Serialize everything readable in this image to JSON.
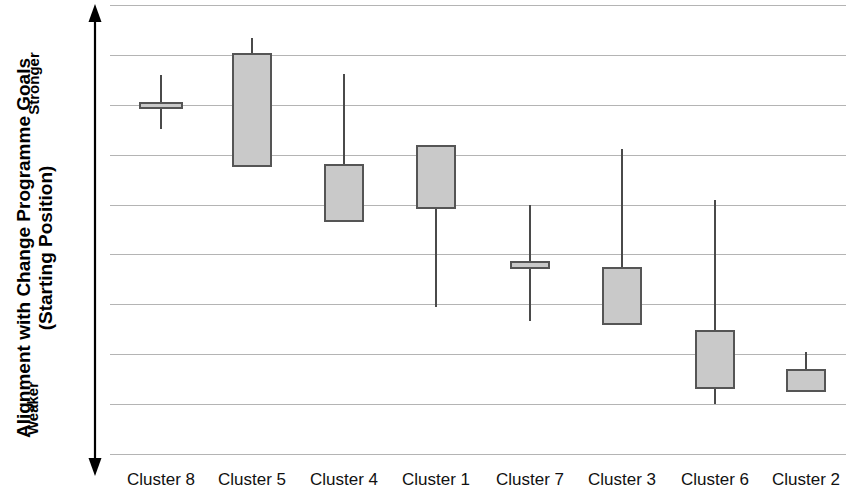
{
  "chart_data": {
    "type": "box",
    "title": "",
    "xlabel": "",
    "ylabel": "Alignment with Change Programme Goals (Starting Position)",
    "ylabel_line1": "Alignment with Change Programme Goals",
    "ylabel_line2": "(Starting Position)",
    "axis_high_label": "Stronger",
    "axis_low_label": "Weaker",
    "y_axis_direction": "Weaker at bottom, Stronger at top",
    "y_axis_ticks_labeled": false,
    "gridlines": 10,
    "grid": true,
    "legend": "none",
    "box_fill_color": "#c9c9c9",
    "box_border_color": "#555555",
    "whisker_color": "#4a4a4a",
    "gridline_color": "#b4b4b4",
    "categories": [
      "Cluster 8",
      "Cluster 5",
      "Cluster 4",
      "Cluster 1",
      "Cluster 7",
      "Cluster 3",
      "Cluster 6",
      "Cluster 2"
    ],
    "series": [
      {
        "name": "Alignment range",
        "boxes": [
          {
            "category": "Cluster 8",
            "whisker_high_px": 75,
            "box_top_px": 102,
            "box_bottom_px": 109,
            "whisker_low_px": 129,
            "center_px": 161,
            "width_px": 44
          },
          {
            "category": "Cluster 5",
            "whisker_high_px": 38,
            "box_top_px": 53,
            "box_bottom_px": 167,
            "whisker_low_px": 167,
            "center_px": 252,
            "width_px": 40
          },
          {
            "category": "Cluster 4",
            "whisker_high_px": 74,
            "box_top_px": 164,
            "box_bottom_px": 222,
            "whisker_low_px": 222,
            "center_px": 344,
            "width_px": 40
          },
          {
            "category": "Cluster 1",
            "whisker_high_px": 145,
            "box_top_px": 145,
            "box_bottom_px": 209,
            "whisker_low_px": 307,
            "center_px": 436,
            "width_px": 40
          },
          {
            "category": "Cluster 7",
            "whisker_high_px": 205,
            "box_top_px": 261,
            "box_bottom_px": 269,
            "whisker_low_px": 321,
            "center_px": 530,
            "width_px": 40
          },
          {
            "category": "Cluster 3",
            "whisker_high_px": 149,
            "box_top_px": 267,
            "box_bottom_px": 325,
            "whisker_low_px": 325,
            "center_px": 622,
            "width_px": 40
          },
          {
            "category": "Cluster 6",
            "whisker_high_px": 200,
            "box_top_px": 330,
            "box_bottom_px": 389,
            "whisker_low_px": 404,
            "center_px": 715,
            "width_px": 40
          },
          {
            "category": "Cluster 2",
            "whisker_high_px": 352,
            "box_top_px": 369,
            "box_bottom_px": 392,
            "whisker_low_px": 392,
            "center_px": 806,
            "width_px": 40
          }
        ]
      }
    ],
    "gridline_positions_px": [
      5,
      55,
      105,
      155,
      205,
      254,
      304,
      354,
      404,
      454
    ]
  }
}
